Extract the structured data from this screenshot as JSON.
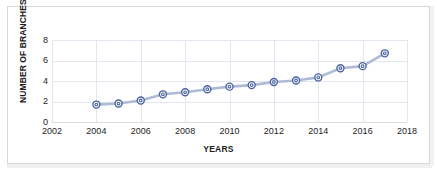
{
  "chart_data": {
    "type": "line",
    "title": "",
    "xlabel": "YEARS",
    "ylabel": "NUMBER OF BRANCHES",
    "x": [
      2004,
      2005,
      2006,
      2007,
      2008,
      2009,
      2010,
      2011,
      2012,
      2013,
      2014,
      2015,
      2016,
      2017
    ],
    "values": [
      1.7,
      1.8,
      2.1,
      2.7,
      2.9,
      3.2,
      3.45,
      3.6,
      3.9,
      4.05,
      4.35,
      5.25,
      5.45,
      6.7
    ],
    "series": [
      {
        "name": "Number of branches",
        "values": [
          1.7,
          1.8,
          2.1,
          2.7,
          2.9,
          3.2,
          3.45,
          3.6,
          3.9,
          4.05,
          4.35,
          5.25,
          5.45,
          6.7
        ]
      }
    ],
    "xlim": [
      2002,
      2018
    ],
    "ylim": [
      0,
      8
    ],
    "xticks": [
      2002,
      2004,
      2006,
      2008,
      2010,
      2012,
      2014,
      2016,
      2018
    ],
    "yticks": [
      0,
      2,
      4,
      6,
      8
    ],
    "xtick_labels": [
      "2002",
      "2004",
      "2006",
      "2008",
      "2010",
      "2012",
      "2014",
      "2016",
      "2018"
    ],
    "ytick_labels": [
      "0",
      "2",
      "4",
      "6",
      "8"
    ],
    "grid": "horizontal-and-vertical",
    "legend": "none",
    "line_color": "#aebad6",
    "marker_color": "#4a63a0",
    "marker_fill": "#ffffff",
    "grid_color": "#e2e6ee",
    "text_color": "#1d1d1d"
  }
}
